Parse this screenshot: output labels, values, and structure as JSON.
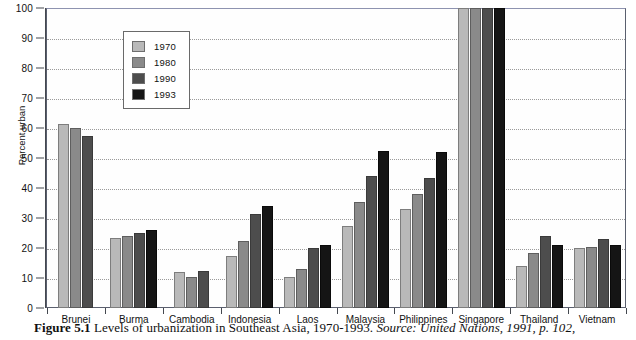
{
  "figure": {
    "caption_number": "Figure 5.1",
    "caption_text": "Levels of urbanization in Southeast Asia, 1970-1993.",
    "caption_source": "Source: United Nations, 1991, p. 102,"
  },
  "legend": {
    "entries": [
      {
        "label": "1970",
        "color": "#b9b9b9"
      },
      {
        "label": "1980",
        "color": "#8a8a8a"
      },
      {
        "label": "1990",
        "color": "#4d4d4d"
      },
      {
        "label": "1993",
        "color": "#151515"
      }
    ]
  },
  "axes": {
    "ylabel": "Percent urban",
    "yticks": [
      "0",
      "10",
      "20",
      "30",
      "40",
      "50",
      "60",
      "70",
      "80",
      "90",
      "100"
    ]
  },
  "chart_data": {
    "type": "bar",
    "title": "Levels of urbanization in Southeast Asia, 1970-1993",
    "xlabel": "",
    "ylabel": "Percent urban",
    "ylim": [
      0,
      100
    ],
    "ytick_step": 10,
    "grid": true,
    "legend_position": "inside-top-left",
    "categories": [
      "Brunei",
      "Burma",
      "Cambodia",
      "Indonesia",
      "Laos",
      "Malaysia",
      "Philippines",
      "Singapore",
      "Thailand",
      "Vietnam"
    ],
    "series": [
      {
        "name": "1970",
        "color": "#b9b9b9",
        "values": [
          61.5,
          23.5,
          12.0,
          17.5,
          10.5,
          27.5,
          33.0,
          100.0,
          14.0,
          20.0
        ]
      },
      {
        "name": "1980",
        "color": "#8a8a8a",
        "values": [
          60.0,
          24.0,
          10.5,
          22.5,
          13.0,
          35.5,
          38.0,
          100.0,
          18.5,
          20.5
        ]
      },
      {
        "name": "1990",
        "color": "#4d4d4d",
        "values": [
          57.5,
          25.0,
          12.5,
          31.5,
          20.0,
          44.0,
          43.5,
          100.0,
          24.0,
          23.0
        ]
      },
      {
        "name": "1993",
        "color": "#151515",
        "values": [
          null,
          26.0,
          null,
          34.0,
          21.0,
          52.5,
          52.0,
          100.0,
          21.0,
          21.0
        ]
      }
    ]
  }
}
